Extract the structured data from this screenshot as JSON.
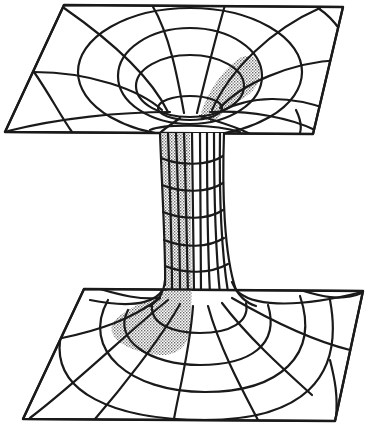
{
  "figure": {
    "caption": "",
    "colors": {
      "ink": "#1a1a1a",
      "stipple": "#9a9a9a",
      "background": "#ffffff"
    },
    "upper_sheet": {
      "corners": [
        [
          64,
          5
        ],
        [
          343,
          7
        ],
        [
          313,
          134
        ],
        [
          5,
          132
        ]
      ],
      "throat_center": [
        190,
        100
      ],
      "rings": [
        {
          "cx": 190,
          "cy": 75,
          "rx": 112,
          "ry": 64
        },
        {
          "cx": 190,
          "cy": 78,
          "rx": 72,
          "ry": 48
        },
        {
          "cx": 190,
          "cy": 86,
          "rx": 52,
          "ry": 32
        },
        {
          "cx": 190,
          "cy": 104,
          "rx": 30,
          "ry": 14
        }
      ]
    },
    "lower_sheet": {
      "corners": [
        [
          84,
          289
        ],
        [
          363,
          291
        ],
        [
          335,
          421
        ],
        [
          23,
          419
        ]
      ],
      "throat_center": [
        195,
        305
      ],
      "rings": [
        {
          "cx": 195,
          "cy": 318,
          "rx": 40,
          "ry": 16
        },
        {
          "cx": 195,
          "cy": 335,
          "rx": 70,
          "ry": 38
        },
        {
          "cx": 195,
          "cy": 345,
          "rx": 110,
          "ry": 60
        },
        {
          "cx": 195,
          "cy": 350,
          "rx": 138,
          "ry": 82
        }
      ]
    },
    "tube": {
      "top_y": 132,
      "bottom_y": 288,
      "left_x_top": 160,
      "right_x_top": 223,
      "rings_y": [
        160,
        188,
        215,
        242,
        268
      ],
      "meridian_count": 9
    },
    "shading": "stippled gray region on back-left of the upper funnel, left side of tube, and front-left of the lower flare"
  }
}
